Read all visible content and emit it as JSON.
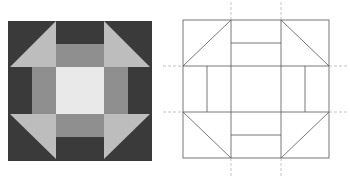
{
  "figure": {
    "colors": {
      "dark": "#3a3a3a",
      "triangle_light": "#bdbdbd",
      "rect_medium": "#8f8f8f",
      "center": "#e9e9e9",
      "outline": "#555555",
      "guide": "#aaaaaa"
    },
    "left_block": {
      "label": "colored block",
      "x": 8,
      "y": 21,
      "w": 144,
      "h": 140
    },
    "right_block": {
      "label": "line diagram",
      "x": 183,
      "y": 20,
      "w": 146,
      "h": 138
    }
  }
}
